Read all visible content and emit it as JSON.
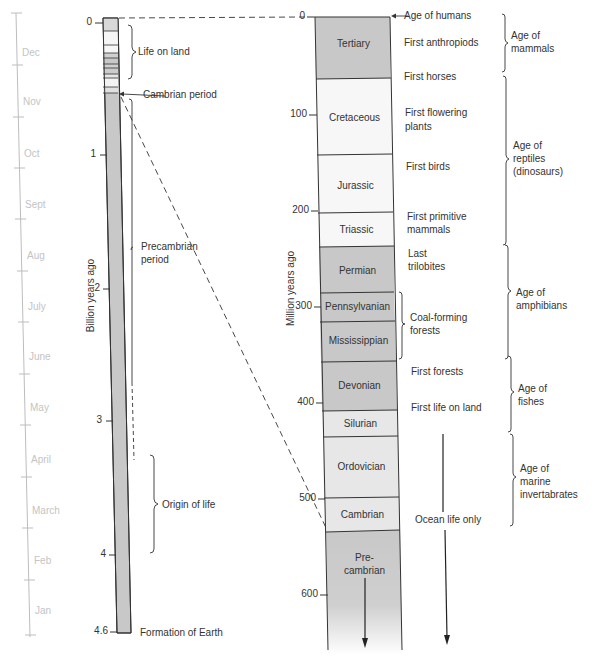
{
  "calendar": {
    "months": [
      "Dec",
      "Nov",
      "Oct",
      "Sept",
      "Aug",
      "July",
      "June",
      "May",
      "April",
      "March",
      "Feb",
      "Jan"
    ]
  },
  "billion_scale": {
    "axis_title": "Billion years ago",
    "ticks": [
      "0",
      "1",
      "2",
      "3",
      "4",
      "4.6"
    ],
    "annotations": {
      "life_on_land": "Life on land",
      "cambrian_period": "Cambrian period",
      "precambrian_period_line1": "Precambrian",
      "precambrian_period_line2": "period",
      "origin_of_life": "Origin of life",
      "formation_of_earth": "Formation of Earth"
    }
  },
  "million_scale": {
    "axis_title": "Million years ago",
    "ticks": [
      "0",
      "100",
      "200",
      "300",
      "400",
      "500",
      "600"
    ],
    "periods": {
      "tertiary": "Tertiary",
      "cretaceous": "Cretaceous",
      "jurassic": "Jurassic",
      "triassic": "Triassic",
      "permian": "Permian",
      "pennsylvanian": "Pennsylvanian",
      "mississippian": "Mississippian",
      "devonian": "Devonian",
      "silurian": "Silurian",
      "ordovician": "Ordovician",
      "cambrian": "Cambrian",
      "precambrian_line1": "Pre-",
      "precambrian_line2": "cambrian"
    },
    "events": {
      "age_of_humans": "Age of humans",
      "first_anthropiods": "First anthropiods",
      "first_horses": "First horses",
      "first_flowering_line1": "First flowering",
      "first_flowering_line2": "plants",
      "first_birds": "First birds",
      "first_primitive_line1": "First primitive",
      "first_primitive_line2": "mammals",
      "last_trilobites_line1": "Last",
      "last_trilobites_line2": "trilobites",
      "coal_forming_line1": "Coal-forming",
      "coal_forming_line2": "forests",
      "first_forests": "First forests",
      "first_life_on_land": "First life on land",
      "ocean_life_only": "Ocean life only"
    },
    "ages": {
      "mammals_line1": "Age of",
      "mammals_line2": "mammals",
      "reptiles_line1": "Age of",
      "reptiles_line2": "reptiles",
      "reptiles_line3": "(dinosaurs)",
      "amphibians_line1": "Age of",
      "amphibians_line2": "amphibians",
      "fishes_line1": "Age of",
      "fishes_line2": "fishes",
      "marine_line1": "Age of",
      "marine_line2": "marine",
      "marine_line3": "invertabrates"
    }
  },
  "colors": {
    "dark_band": "#c8c8c8",
    "light_band": "#e9e9e9",
    "white_band": "#f9f9f9",
    "line": "#333333",
    "month_text": "#c4c4c4"
  }
}
